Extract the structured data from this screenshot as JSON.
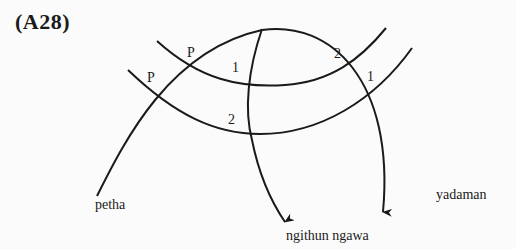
{
  "figure": {
    "title": "(A28)"
  },
  "diagram": {
    "nodes": [
      {
        "id": "petha",
        "label": "petha"
      },
      {
        "id": "ngithun_ngawa",
        "label": "ngithun ngawa"
      },
      {
        "id": "yadaman",
        "label": "yadaman"
      }
    ],
    "crossing_labels": {
      "p_upper": "P",
      "p_lower": "P",
      "left_1": "1",
      "left_2": "2",
      "right_2": "2",
      "right_1": "1"
    }
  },
  "colors": {
    "line": "#1a1a1a",
    "background": "#fbfbfb"
  }
}
